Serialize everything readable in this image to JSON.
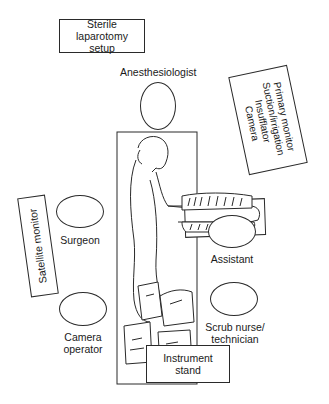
{
  "diagram": {
    "type": "operating-room-layout",
    "boxes": {
      "sterile_setup": {
        "line1": "Sterile laparotomy",
        "line2": "setup"
      },
      "primary_monitor": {
        "lines": [
          "Primary monitor",
          "Suction/irrigation",
          "Insufflator",
          "Camera"
        ]
      },
      "satellite_monitor": {
        "label": "Satellite monitor"
      },
      "instrument_stand": {
        "line1": "Instrument",
        "line2": "stand"
      }
    },
    "personnel": {
      "anesthesiologist": "Anesthesiologist",
      "surgeon": "Surgeon",
      "camera_operator": {
        "line1": "Camera",
        "line2": "operator"
      },
      "assistant": "Assistant",
      "scrub_nurse": {
        "line1": "Scrub nurse/",
        "line2": "technician"
      }
    },
    "central_figure": "Patient positioned on operating table"
  }
}
